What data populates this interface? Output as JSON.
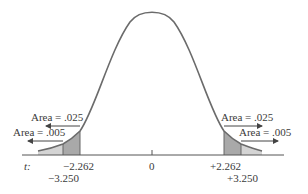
{
  "diagram": {
    "type": "t-distribution",
    "axis_label": "t:",
    "center_label": "0",
    "left": {
      "inner_cut": "−2.262",
      "outer_cut": "−3.250",
      "inner_area": "Area = .025",
      "outer_area": "Area = .005"
    },
    "right": {
      "inner_cut": "+2.262",
      "outer_cut": "+3.250",
      "inner_area": "Area = .025",
      "outer_area": "Area = .005"
    },
    "colors": {
      "curve": "#6b6b6b",
      "axis": "#555555",
      "dark_shade": "#a9a9a9",
      "light_shade": "#d4d4d4",
      "text": "#3a3a3a"
    }
  }
}
